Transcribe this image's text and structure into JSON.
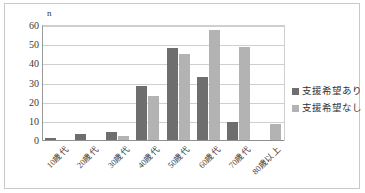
{
  "chart_data": {
    "type": "bar",
    "title": "",
    "xlabel": "",
    "ylabel": "n",
    "unit_label": "n",
    "ylim": [
      0,
      60
    ],
    "yticks": [
      60,
      50,
      40,
      30,
      20,
      10,
      0
    ],
    "grid": true,
    "legend_position": "right",
    "categories": [
      "10歳代",
      "20歳代",
      "30歳代",
      "40歳代",
      "50歳代",
      "60歳代",
      "70歳代",
      "80歳以上"
    ],
    "series": [
      {
        "name": "支援希望あり",
        "color": "#6e6e6e",
        "values": [
          1,
          3,
          4,
          28,
          48,
          33,
          9.5,
          0
        ]
      },
      {
        "name": "支援希望なし",
        "color": "#b3b3b3",
        "values": [
          0,
          0,
          2,
          23,
          45,
          57.5,
          48.5,
          8.5
        ]
      }
    ]
  },
  "legend": {
    "items": [
      {
        "label": "支援希望あり",
        "color": "#6e6e6e"
      },
      {
        "label": "支援希望なし",
        "color": "#b3b3b3"
      }
    ]
  },
  "colors": {
    "series_dark": "#6e6e6e",
    "series_light": "#b3b3b3",
    "gridline": "#cfcfcf",
    "axis": "#8f8f8f",
    "border": "#c9c9c9",
    "background": "#ffffff",
    "text": "#3a3a3a"
  }
}
